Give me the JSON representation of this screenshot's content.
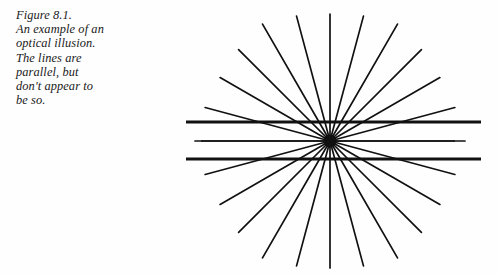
{
  "figure": {
    "caption_label": "Figure 8.1.",
    "caption_text": "Figure 8.1.\nAn example of an\noptical illusion.\nThe lines are\nparallel, but\ndon't appear to\nbe so.",
    "caption_lines": [
      "Figure 8.1.",
      "An example of an",
      "optical illusion.",
      "The lines are",
      "parallel, but",
      "don't appear to",
      "be so."
    ],
    "illusion_name": "Hering illusion",
    "background_color": "#fefefe",
    "ink_color": "#111111"
  },
  "chart_data": {
    "type": "line",
    "title": "Figure 8.1.",
    "xlabel": "",
    "ylabel": "",
    "xlim": [
      0,
      499
    ],
    "ylim": [
      0,
      275
    ],
    "grid": false,
    "legend": "none",
    "annotations": [
      "The lines are parallel, but don't appear to be so."
    ],
    "center": {
      "x": 330,
      "y": 141
    },
    "radial": {
      "name": "radiating-spokes",
      "count": 24,
      "angle_step_deg": 15,
      "start_angle_deg": 0,
      "radius": 135,
      "stroke_width": 1.7,
      "color": "#111111"
    },
    "parallel_lines": [
      {
        "name": "upper-parallel-line",
        "y": 122,
        "x1": 186,
        "x2": 481,
        "stroke_width": 3.1,
        "color": "#111111"
      },
      {
        "name": "middle-parallel-line",
        "y": 141,
        "x1": 201,
        "x2": 455,
        "stroke_width": 1.5,
        "color": "#111111"
      },
      {
        "name": "lower-parallel-line",
        "y": 159,
        "x1": 186,
        "x2": 481,
        "stroke_width": 3.1,
        "color": "#111111"
      }
    ],
    "center_dot": {
      "r": 6.5,
      "color": "#111111"
    }
  }
}
